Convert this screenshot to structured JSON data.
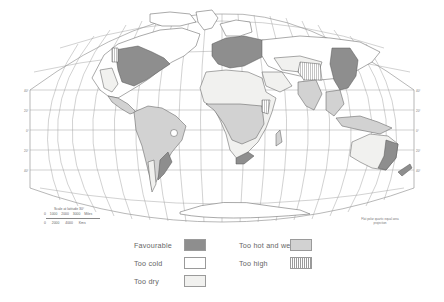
{
  "map": {
    "projection_note": "Flat polar quartic equal area projection",
    "scale": {
      "title": "Scale at latitude 30°",
      "miles": "0   1000   2000   3000 Miles",
      "kms": "0    2000    4000    Kms"
    },
    "latitude_labels": [
      "40°",
      "20°",
      "0°",
      "20°",
      "40°",
      "60°"
    ],
    "colors": {
      "favourable": "#8e8e8e",
      "too_cold": "#ffffff",
      "too_dry": "#f1f1ef",
      "too_hot_and_wet": "#d2d2d2",
      "too_high": "#9a9a9a",
      "outline": "#555555",
      "graticule": "#9a9a9a"
    }
  },
  "legend": {
    "items": [
      {
        "label": "Favourable",
        "swatch": "favourable"
      },
      {
        "label": "Too cold",
        "swatch": "too_cold"
      },
      {
        "label": "Too dry",
        "swatch": "too_dry"
      },
      {
        "label": "Too hot and wet",
        "swatch": "too_hot_and_wet"
      },
      {
        "label": "Too high",
        "swatch": "too_high_hatched"
      }
    ]
  }
}
